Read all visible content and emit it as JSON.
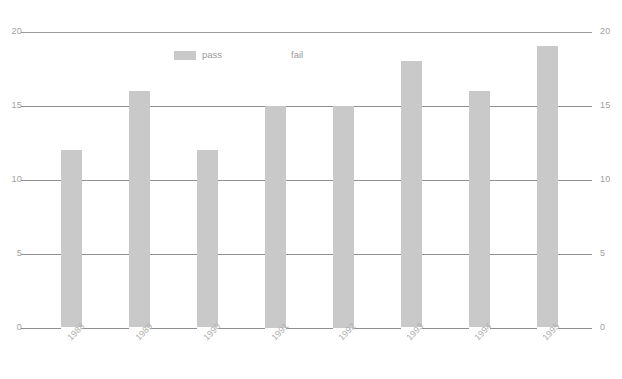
{
  "chart_data": {
    "type": "bar",
    "title": "",
    "subtitle": "",
    "xlabel": "",
    "ylabel": "",
    "categories": [
      "1988",
      "1989",
      "1990",
      "1991",
      "1992",
      "1993",
      "1994",
      "1995"
    ],
    "series": [
      {
        "name": "pass",
        "color": "#c9c9c9",
        "values": [
          12,
          16,
          12,
          15,
          15,
          18,
          16,
          19
        ]
      },
      {
        "name": "fail",
        "color": "#ffffff",
        "values": [
          0,
          0,
          0,
          0,
          0,
          0,
          0,
          0
        ]
      }
    ],
    "values": [
      12,
      16,
      12,
      15,
      15,
      18,
      16,
      19
    ],
    "ylim": [
      0,
      20
    ],
    "ytick_values": [
      0,
      5,
      10,
      15,
      20
    ],
    "ytick_labels_left": [
      "0",
      "5",
      "10",
      "15",
      "20"
    ],
    "ytick_labels_right": [
      "0",
      "5",
      "10",
      "15",
      "20"
    ],
    "grid": true,
    "grid_orientation": "horizontal",
    "legend": {
      "position": "top-center",
      "entries": [
        {
          "label": "pass",
          "swatch": "#c9c9c9"
        },
        {
          "label": "fail",
          "swatch": "#ffffff"
        }
      ]
    },
    "xtick_rotation_degrees": -45,
    "colors": {
      "background": "#ffffff",
      "bar": "#c9c9c9",
      "gridline": "#8f8f8f",
      "axis_text": "#a0a0a0",
      "xtick_text": "#b0b0b0"
    }
  },
  "legend": {
    "pass_label": "pass",
    "fail_label": "fail"
  },
  "footer": {
    "watermark": ""
  }
}
